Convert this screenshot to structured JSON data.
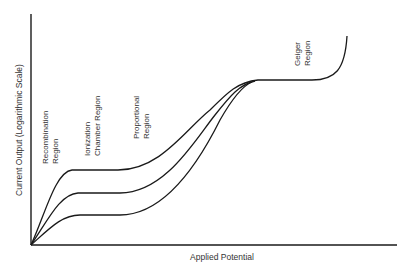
{
  "diagram": {
    "x_axis_label": "Applied Potential",
    "y_axis_label": "Current Output (Logarithmic Scale)",
    "regions": [
      {
        "lines": [
          "Recombination",
          "Region"
        ]
      },
      {
        "lines": [
          "Ionization",
          "Chamber Region"
        ]
      },
      {
        "lines": [
          "Proportional",
          "Region"
        ]
      },
      {
        "lines": [
          "Geiger",
          "Region"
        ]
      }
    ],
    "curves": [
      {
        "name": "high-ionization",
        "plateau_y": 170
      },
      {
        "name": "medium-ionization",
        "plateau_y": 193
      },
      {
        "name": "low-ionization",
        "plateau_y": 215
      }
    ],
    "line_color": "#1a1a1a",
    "text_color": "#333333"
  }
}
